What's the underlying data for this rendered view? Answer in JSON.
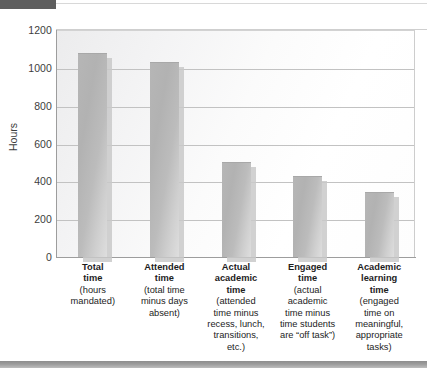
{
  "chart_data": {
    "type": "bar",
    "title": "",
    "subtitle": "",
    "xlabel": "",
    "ylabel": "Hours",
    "ylim": [
      0,
      1200
    ],
    "ytick_values": [
      1200,
      1000,
      800,
      600,
      400,
      200,
      0
    ],
    "ytick_labels": [
      "1200",
      "1000",
      "800",
      "600",
      "400",
      "200",
      "0"
    ],
    "grid": true,
    "legend": "none",
    "bar_color": "#b6b6b6",
    "categories": [
      "Total time (hours mandated)",
      "Attended time (total time minus days absent)",
      "Actual academic time (attended time minus recess, lunch, transitions, etc.)",
      "Engaged time (actual academic time minus time students are “off task”)",
      "Academic learning time (engaged time on meaningful, appropriate tasks)"
    ],
    "values": [
      1080,
      1030,
      500,
      430,
      345
    ]
  },
  "axis": {
    "y_title": "Hours",
    "ticks": [
      {
        "label": "1200",
        "value": 1200
      },
      {
        "label": "1000",
        "value": 1000
      },
      {
        "label": "800",
        "value": 800
      },
      {
        "label": "600",
        "value": 600
      },
      {
        "label": "400",
        "value": 400
      },
      {
        "label": "200",
        "value": 200
      },
      {
        "label": "0",
        "value": 0
      }
    ]
  },
  "bars": [
    {
      "value": 1080,
      "head": "Total\ntime",
      "sub": "(hours\nmandated)",
      "head_line1": "Total",
      "head_line2": "time",
      "sub_text": "(hours mandated)"
    },
    {
      "value": 1030,
      "head_line1": "Attended",
      "head_line2": "time",
      "sub_text": "(total time minus days absent)"
    },
    {
      "value": 500,
      "head_line1": "Actual",
      "head_line2": "academic",
      "head_line3": "time",
      "sub_text": "(attended time minus recess, lunch, transitions, etc.)"
    },
    {
      "value": 430,
      "head_line1": "Engaged",
      "head_line2": "time",
      "sub_text": "(actual academic time minus time students are “off task”)"
    },
    {
      "value": 345,
      "head_line1": "Academic",
      "head_line2": "learning",
      "head_line3": "time",
      "sub_text": "(engaged time on meaningful, appropriate tasks)"
    }
  ],
  "labels": {
    "b0_head": "Total\ntime",
    "b0_sub": "(hours\nmandated)",
    "b1_head": "Attended\ntime",
    "b1_sub": "(total time\nminus days\nabsent)",
    "b2_head": "Actual\nacademic\ntime",
    "b2_sub": "(attended\ntime minus\nrecess, lunch,\ntransitions,\netc.)",
    "b3_head": "Engaged\ntime",
    "b3_sub": "(actual\nacademic\ntime minus\ntime students\nare “off task”)",
    "b4_head": "Academic\nlearning\ntime",
    "b4_sub": "(engaged\ntime on\nmeaningful,\nappropriate\ntasks)"
  }
}
